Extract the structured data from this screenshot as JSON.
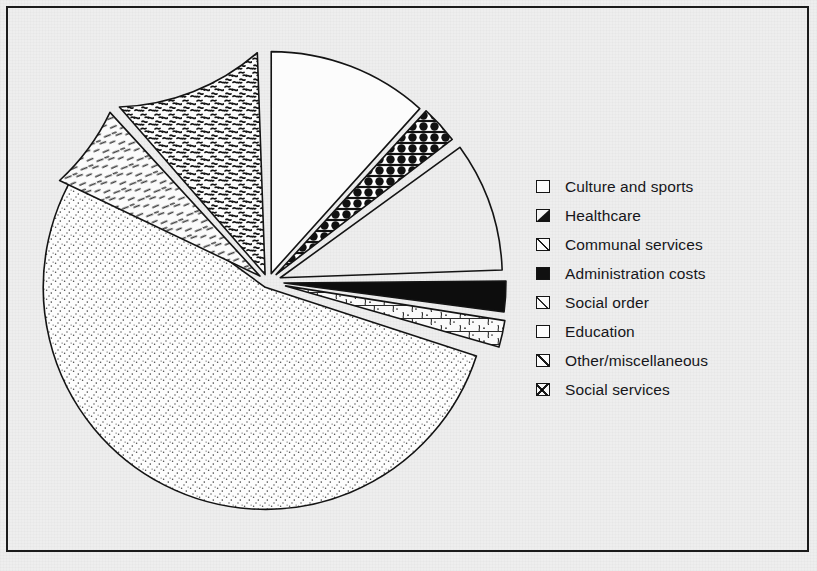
{
  "figure": {
    "background_color": "#eeeeee",
    "border_color": "#1b1b1b",
    "ink_color": "#141414"
  },
  "legend": {
    "position": "right",
    "items": [
      {
        "label": "Culture and sports",
        "swatch": "plain-white-square",
        "pattern": "plain",
        "swatch_class": "sw-plain"
      },
      {
        "label": "Healthcare",
        "swatch": "black-with-white-dots",
        "pattern": "dots-on-black",
        "swatch_class": "sw-dots-black"
      },
      {
        "label": "Communal services",
        "swatch": "diagonal-hatch",
        "pattern": "diagonal-hatch",
        "swatch_class": "sw-diag"
      },
      {
        "label": "Administration costs",
        "swatch": "solid-black",
        "pattern": "solid",
        "swatch_class": "sw-solid"
      },
      {
        "label": "Social order",
        "swatch": "stone-cobble",
        "pattern": "cobble",
        "swatch_class": "sw-stone"
      },
      {
        "label": "Education",
        "swatch": "fine-stipple-dots",
        "pattern": "stipple",
        "swatch_class": "sw-dot"
      },
      {
        "label": "Other/miscellaneous",
        "swatch": "dense-squiggle",
        "pattern": "squiggle",
        "swatch_class": "sw-squig"
      },
      {
        "label": "Social services",
        "swatch": "sparse-dashes",
        "pattern": "dashes",
        "swatch_class": "sw-dash"
      }
    ]
  },
  "chart_data": {
    "type": "pie",
    "title": "",
    "subtitle": "",
    "xlabel": "",
    "ylabel": "",
    "units": "percent of budget (estimated from slice angles)",
    "exploded": true,
    "start_angle_deg": 90,
    "direction": "clockwise",
    "center": {
      "x": 268,
      "y": 282
    },
    "radius": 222,
    "categories": [
      "Culture and sports",
      "Healthcare",
      "Communal services",
      "Administration costs",
      "Social order",
      "Education",
      "Other/miscellaneous",
      "Social services"
    ],
    "values": [
      11.7,
      2.8,
      9.4,
      2.2,
      1.9,
      55.0,
      10.8,
      6.2
    ],
    "angles_deg": [
      42,
      10,
      34,
      8,
      7,
      198,
      39,
      22
    ],
    "slices": [
      {
        "name": "Culture and sports",
        "value": 11.7,
        "angle_deg": 42,
        "start_deg": 90,
        "end_deg": 48,
        "pattern": "plain",
        "fill": "#fcfcfc",
        "explode": 9
      },
      {
        "name": "Healthcare",
        "value": 2.8,
        "angle_deg": 10,
        "start_deg": 47.5,
        "end_deg": 37.5,
        "pattern": "dots-on-black",
        "fill": "#111111",
        "explode": 11
      },
      {
        "name": "Communal services",
        "value": 9.4,
        "angle_deg": 34,
        "start_deg": 36,
        "end_deg": 2,
        "pattern": "diagonal-hatch",
        "fill": "#fcfcfc",
        "explode": 13
      },
      {
        "name": "Administration costs",
        "value": 2.2,
        "angle_deg": 8,
        "start_deg": 0.5,
        "end_deg": -7.5,
        "pattern": "solid",
        "fill": "#0d0d0d",
        "explode": 16
      },
      {
        "name": "Social order",
        "value": 1.9,
        "angle_deg": 7,
        "start_deg": -9,
        "end_deg": -16,
        "pattern": "cobble",
        "fill": "#fafafa",
        "explode": 18
      },
      {
        "name": "Education",
        "value": 55.0,
        "angle_deg": 198,
        "start_deg": -18,
        "end_deg": -216,
        "pattern": "stipple",
        "fill": "#fdfdfd",
        "explode": 6
      },
      {
        "name": "Other/miscellaneous",
        "value": 10.8,
        "angle_deg": 39,
        "start_deg": 92,
        "end_deg": 131,
        "pattern": "squiggle",
        "fill": "#fcfcfc",
        "explode": 8
      },
      {
        "name": "Social services",
        "value": 6.2,
        "angle_deg": 22,
        "start_deg": 132.5,
        "end_deg": 154.5,
        "pattern": "dashes",
        "fill": "#fbfbfb",
        "explode": 10
      }
    ],
    "legend_position": "right",
    "grid": false
  }
}
